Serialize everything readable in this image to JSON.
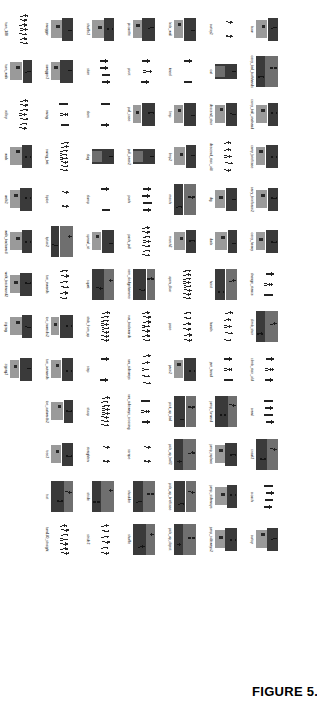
{
  "figure": {
    "caption": "FIGURE 5.12",
    "columns": 16,
    "rows": 6,
    "palette": {
      "dark": "#3a3a3a",
      "mid": "#6f6f6f",
      "light": "#9a9a9a",
      "paper": "#ffffff",
      "ink": "#111111"
    },
    "grid": [
      [
        {
          "label": "bow",
          "style": "block-split"
        },
        {
          "label": "carry_ball_bothhands",
          "style": "block-wide"
        },
        {
          "label": "carry_ball_onehand",
          "style": "block-split"
        },
        {
          "label": "carry_briefcase",
          "style": "block-split"
        },
        {
          "label": "carry_briefcase2",
          "style": "block-split"
        },
        {
          "label": "carry_heavy",
          "style": "block-split"
        },
        {
          "label": "change_stance",
          "style": "stick-row"
        },
        {
          "label": "climb_stair",
          "style": "block-wide"
        },
        {
          "label": "climb_stair_old",
          "style": "stick-row"
        },
        {
          "label": "crawl",
          "style": "stick-row"
        },
        {
          "label": "crawl2",
          "style": "block-wide"
        },
        {
          "label": "crouch",
          "style": "stick-row"
        },
        {
          "label": "curtsy",
          "style": "block-split"
        },
        {
          "label": "",
          "style": "none"
        },
        {
          "label": "",
          "style": "none"
        },
        {
          "label": "",
          "style": "none"
        }
      ],
      [
        {
          "label": "curtsy2",
          "style": "stick-sparse"
        },
        {
          "label": "cut",
          "style": "block-tall"
        },
        {
          "label": "descend_stair",
          "style": "block-split"
        },
        {
          "label": "descend_stair_old",
          "style": "stick-dense"
        },
        {
          "label": "dig",
          "style": "block-split"
        },
        {
          "label": "duck",
          "style": "block-split"
        },
        {
          "label": "hoist",
          "style": "block-wide"
        },
        {
          "label": "hunch",
          "style": "stick-dense"
        },
        {
          "label": "jam_hand",
          "style": "stick-row"
        },
        {
          "label": "jump_forward",
          "style": "block-wide"
        },
        {
          "label": "jump_inplace",
          "style": "block-split"
        },
        {
          "label": "jump_sideways",
          "style": "block-split"
        },
        {
          "label": "jump_sideways2",
          "style": "block-split"
        },
        {
          "label": "",
          "style": "none"
        },
        {
          "label": "",
          "style": "none"
        },
        {
          "label": "",
          "style": "none"
        }
      ],
      [
        {
          "label": "kick_wall",
          "style": "block-split"
        },
        {
          "label": "kneel",
          "style": "stick-row"
        },
        {
          "label": "limp",
          "style": "block-split"
        },
        {
          "label": "limp2",
          "style": "block-split"
        },
        {
          "label": "march",
          "style": "block-wide"
        },
        {
          "label": "march2",
          "style": "block-split"
        },
        {
          "label": "open_door",
          "style": "stick-dense"
        },
        {
          "label": "pace",
          "style": "stick-dense"
        },
        {
          "label": "pace2",
          "style": "block-split"
        },
        {
          "label": "pick_up_ball",
          "style": "block-wide"
        },
        {
          "label": "pick_up_ball2",
          "style": "block-wide"
        },
        {
          "label": "pick_up_briefcase",
          "style": "block-wide"
        },
        {
          "label": "pick_up_object",
          "style": "block-wide"
        },
        {
          "label": "",
          "style": "none"
        },
        {
          "label": "",
          "style": "none"
        },
        {
          "label": "",
          "style": "none"
        }
      ],
      [
        {
          "label": "pirouette",
          "style": "block-split"
        },
        {
          "label": "pivot",
          "style": "stick-row"
        },
        {
          "label": "pull_case",
          "style": "block-split"
        },
        {
          "label": "pull_case2",
          "style": "block-tall"
        },
        {
          "label": "push",
          "style": "stick-row"
        },
        {
          "label": "push_pull",
          "style": "stick-dense"
        },
        {
          "label": "ram_sledgehammer",
          "style": "block-wide"
        },
        {
          "label": "run_backwards",
          "style": "stick-dense"
        },
        {
          "label": "run_sideways",
          "style": "stick-dense"
        },
        {
          "label": "run_sideways_crossing",
          "style": "stick-row"
        },
        {
          "label": "scrape",
          "style": "stick-sparse"
        },
        {
          "label": "shoulder",
          "style": "block-wide"
        },
        {
          "label": "shuffle",
          "style": "block-wide"
        },
        {
          "label": "",
          "style": "none"
        },
        {
          "label": "",
          "style": "none"
        },
        {
          "label": "",
          "style": "none"
        }
      ],
      [
        {
          "label": "shuffle2",
          "style": "block-split"
        },
        {
          "label": "skim",
          "style": "stick-row"
        },
        {
          "label": "slam",
          "style": "stick-row"
        },
        {
          "label": "slug",
          "style": "block-tall"
        },
        {
          "label": "slump",
          "style": "stick-row"
        },
        {
          "label": "sprawl_sit",
          "style": "block-split"
        },
        {
          "label": "squat",
          "style": "block-wide"
        },
        {
          "label": "stab_from_up",
          "style": "stick-dense"
        },
        {
          "label": "step",
          "style": "stick-row"
        },
        {
          "label": "stoop",
          "style": "stick-dense"
        },
        {
          "label": "straighten",
          "style": "stick-sparse"
        },
        {
          "label": "stride",
          "style": "block-wide"
        },
        {
          "label": "stride2",
          "style": "stick-dense"
        },
        {
          "label": "",
          "style": "none"
        },
        {
          "label": "",
          "style": "none"
        },
        {
          "label": "",
          "style": "none"
        }
      ],
      [
        {
          "label": "swagger",
          "style": "block-split"
        },
        {
          "label": "swagger2",
          "style": "block-split"
        },
        {
          "label": "swing",
          "style": "stick-row"
        },
        {
          "label": "swing_bat",
          "style": "stick-dense"
        },
        {
          "label": "tiptoe",
          "style": "stick-sparse"
        },
        {
          "label": "tiptoe2",
          "style": "block-wide"
        },
        {
          "label": "toe_inwards",
          "style": "stick-dense"
        },
        {
          "label": "toe_inwards2",
          "style": "block-split"
        },
        {
          "label": "toe_outwards",
          "style": "block-split"
        },
        {
          "label": "toe_outwards2",
          "style": "block-split"
        },
        {
          "label": "tree2",
          "style": "block-split"
        },
        {
          "label": "trot",
          "style": "block-wide"
        },
        {
          "label": "turn180_straight",
          "style": "stick-dense"
        },
        {
          "label": "",
          "style": "none"
        },
        {
          "label": "",
          "style": "none"
        },
        {
          "label": "",
          "style": "none"
        }
      ],
      [
        {
          "label": "turn_180",
          "style": "stick-dense"
        },
        {
          "label": "turn_walk",
          "style": "block-split"
        },
        {
          "label": "volley",
          "style": "stick-dense"
        },
        {
          "label": "walk",
          "style": "block-split"
        },
        {
          "label": "walk2",
          "style": "block-split"
        },
        {
          "label": "walk_backward",
          "style": "block-split"
        },
        {
          "label": "walk_backward2",
          "style": "block-split"
        },
        {
          "label": "zigzag",
          "style": "block-split"
        },
        {
          "label": "zigzag2",
          "style": "block-split"
        },
        {
          "label": "",
          "style": "none"
        },
        {
          "label": "",
          "style": "none"
        },
        {
          "label": "",
          "style": "none"
        },
        {
          "label": "",
          "style": "none"
        },
        {
          "label": "",
          "style": "none"
        },
        {
          "label": "",
          "style": "none"
        },
        {
          "label": "",
          "style": "none"
        }
      ]
    ]
  }
}
